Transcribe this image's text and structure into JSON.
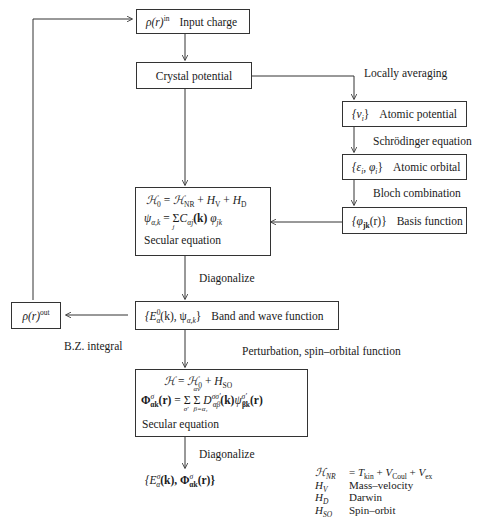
{
  "diagram": {
    "type": "flowchart",
    "nodes": {
      "input_charge": {
        "symbol": "ρ(r)",
        "sup": "in",
        "label": "Input charge"
      },
      "crystal_potential": {
        "label": "Crystal potential"
      },
      "atomic_potential": {
        "symbol": "{v",
        "sub": "i",
        "close": "}",
        "label": "Atomic potential"
      },
      "atomic_orbital": {
        "symbol": "{ε",
        "sub": "i",
        "mid": ", φ",
        "sub2": "i",
        "close": "}",
        "label": "Atomic orbital"
      },
      "basis_function": {
        "symbol": "{φ",
        "sub": "jk",
        "close": "(r)}",
        "label": "Basis function"
      },
      "secular_box_1": {
        "line1": "ℋ₀ = ℋ_NR + H_V + H_D",
        "line1_parts": {
          "lhs": "ℋ",
          "lhs_sub": "0",
          "eq": " = ",
          "t1": "ℋ",
          "t1_sub": "NR",
          "plus1": " + ",
          "t2": "H",
          "t2_sub": "V",
          "plus2": " + ",
          "t3": "H",
          "t3_sub": "D"
        },
        "line2": "ψ_α,k = Σ_j C_αj(k) φ_jk",
        "line2_parts": {
          "lhs": "ψ",
          "lhs_sub": "α,k",
          "eq": " = ",
          "sum": "Σ",
          "sum_below": "j",
          "c": "C",
          "c_sub": "αj",
          "k": "(k)",
          "phi": " φ",
          "phi_sub": "jk"
        },
        "line3": "Secular equation"
      },
      "band_wave": {
        "symbol": "{E",
        "sup": "0",
        "sub": "α",
        "mid": "(k), ψ",
        "sub2": "α,k",
        "close": "}",
        "label": "Band and wave function"
      },
      "output_charge": {
        "symbol": "ρ(r)",
        "sup": "out"
      },
      "secular_box_2": {
        "line1": "ℋ = ℋ₀ + H_SO",
        "line1_parts": {
          "lhs": "ℋ",
          "eq": " = ",
          "t1": "ℋ",
          "t1_sub": "0",
          "plus": " + ",
          "t2": "H",
          "t2_sub": "SO"
        },
        "line2": "Φ^σ_αk(r) = Σ_σ' Σ_{β=α1}^{αν} D^{σσ'}_{αβ}(k) ψ^{σ'}_{βk}(r)",
        "line2_parts": {
          "lhs": "Φ",
          "lhs_sup": "σ",
          "lhs_sub": "αk",
          "lhs_arg": "(r)",
          "eq": " = ",
          "sum1": "Σ",
          "sum1_below": "σ'",
          "sum2": "Σ",
          "sum2_above": "αν",
          "sum2_below": "β=α₁",
          "d": " D",
          "d_sup": "σσ'",
          "d_sub": "αβ",
          "k": "(k)",
          "psi": "ψ",
          "psi_sup": "σ'",
          "psi_sub": "βk",
          "psi_arg": "(r)"
        },
        "line3": "Secular equation"
      },
      "final_result": {
        "text": "{E^σ_α(k), Φ^σ_αk(r)}",
        "e": "{E",
        "e_sup": "σ",
        "e_sub": "α",
        "mid": "(k), Φ",
        "phi_sup": "σ",
        "phi_sub": "αk",
        "close": "(r)}"
      }
    },
    "edge_labels": {
      "locally_averaging": "Locally averaging",
      "schrodinger": "Schrödinger equation",
      "bloch": "Bloch combination",
      "diagonalize_1": "Diagonalize",
      "bz_integral": "B.Z. integral",
      "perturbation": "Perturbation, spin–orbital function",
      "diagonalize_2": "Diagonalize"
    },
    "legend": [
      {
        "key": "ℋ",
        "key_sub": "NR",
        "value": "= T_kin + V_Coul + V_ex",
        "value_parts": {
          "eq": "= ",
          "t": "T",
          "t_sub": "kin",
          "p1": " + ",
          "v1": "V",
          "v1_sub": "Coul",
          "p2": " + ",
          "v2": "V",
          "v2_sub": "ex"
        }
      },
      {
        "key": "H",
        "key_sub": "V",
        "value": "Mass–velocity"
      },
      {
        "key": "H",
        "key_sub": "D",
        "value": "Darwin"
      },
      {
        "key": "H",
        "key_sub": "SO",
        "value": "Spin–orbit"
      }
    ],
    "colors": {
      "line": "#333333",
      "text": "#1a1a1a",
      "background": "#ffffff"
    }
  }
}
